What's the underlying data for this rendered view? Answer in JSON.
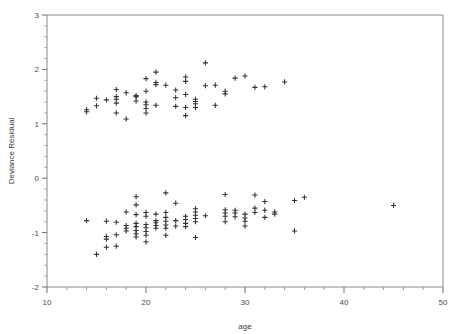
{
  "chart_data": {
    "type": "scatter",
    "title": "",
    "xlabel": "age",
    "ylabel": "Deviance  Residual",
    "xlim": [
      10,
      50
    ],
    "ylim": [
      -2,
      3
    ],
    "xticks": [
      10,
      20,
      30,
      40,
      50
    ],
    "xtick_labels": [
      "10",
      "20",
      "30",
      "40",
      "50"
    ],
    "yticks": [
      -2,
      -1,
      0,
      1,
      2,
      3
    ],
    "ytick_labels": [
      "-2",
      "-1",
      "0",
      "1",
      "2",
      "3"
    ],
    "x_minor_step": 2,
    "y_minor_step": 0.2,
    "grid": false,
    "legend": "none",
    "marker": "plus",
    "marker_color": "#333333",
    "series": [
      {
        "name": "Deviance residuals",
        "points": [
          [
            14.0,
            1.26
          ],
          [
            14.0,
            1.22
          ],
          [
            15.0,
            1.47
          ],
          [
            15.0,
            1.33
          ],
          [
            16.0,
            1.44
          ],
          [
            17.0,
            1.63
          ],
          [
            17.0,
            1.5
          ],
          [
            17.0,
            1.45
          ],
          [
            17.0,
            1.38
          ],
          [
            17.0,
            1.2
          ],
          [
            18.0,
            1.57
          ],
          [
            18.0,
            1.09
          ],
          [
            19.0,
            1.52
          ],
          [
            19.0,
            1.5
          ],
          [
            19.0,
            1.42
          ],
          [
            20.0,
            1.83
          ],
          [
            20.0,
            1.6
          ],
          [
            20.0,
            1.4
          ],
          [
            20.0,
            1.35
          ],
          [
            20.0,
            1.28
          ],
          [
            20.0,
            1.2
          ],
          [
            21.0,
            1.95
          ],
          [
            21.0,
            1.76
          ],
          [
            21.0,
            1.72
          ],
          [
            21.0,
            1.34
          ],
          [
            22.0,
            1.71
          ],
          [
            23.0,
            1.62
          ],
          [
            23.0,
            1.48
          ],
          [
            23.0,
            1.32
          ],
          [
            24.0,
            1.86
          ],
          [
            24.0,
            1.78
          ],
          [
            24.0,
            1.54
          ],
          [
            24.0,
            1.3
          ],
          [
            24.0,
            1.15
          ],
          [
            25.0,
            1.45
          ],
          [
            25.0,
            1.41
          ],
          [
            25.0,
            1.37
          ],
          [
            25.0,
            1.3
          ],
          [
            26.0,
            2.12
          ],
          [
            26.0,
            1.7
          ],
          [
            27.0,
            1.71
          ],
          [
            27.0,
            1.34
          ],
          [
            28.0,
            1.6
          ],
          [
            28.0,
            1.55
          ],
          [
            29.0,
            1.84
          ],
          [
            30.0,
            1.88
          ],
          [
            31.0,
            1.67
          ],
          [
            32.0,
            1.68
          ],
          [
            34.0,
            1.77
          ],
          [
            14.0,
            -0.78
          ],
          [
            15.0,
            -1.4
          ],
          [
            16.0,
            -0.79
          ],
          [
            16.0,
            -1.07
          ],
          [
            16.0,
            -1.12
          ],
          [
            16.0,
            -1.27
          ],
          [
            17.0,
            -0.81
          ],
          [
            17.0,
            -1.04
          ],
          [
            17.0,
            -1.25
          ],
          [
            18.0,
            -0.62
          ],
          [
            18.0,
            -0.87
          ],
          [
            18.0,
            -0.92
          ],
          [
            18.0,
            -0.97
          ],
          [
            19.0,
            -0.34
          ],
          [
            19.0,
            -0.49
          ],
          [
            19.0,
            -0.67
          ],
          [
            19.0,
            -0.83
          ],
          [
            19.0,
            -0.89
          ],
          [
            19.0,
            -0.96
          ],
          [
            19.0,
            -1.02
          ],
          [
            19.0,
            -1.08
          ],
          [
            20.0,
            -0.63
          ],
          [
            20.0,
            -0.7
          ],
          [
            20.0,
            -0.85
          ],
          [
            20.0,
            -0.91
          ],
          [
            20.0,
            -0.98
          ],
          [
            20.0,
            -1.05
          ],
          [
            20.0,
            -1.17
          ],
          [
            21.0,
            -0.66
          ],
          [
            21.0,
            -0.78
          ],
          [
            21.0,
            -0.82
          ],
          [
            21.0,
            -0.87
          ],
          [
            21.0,
            -0.92
          ],
          [
            22.0,
            -0.27
          ],
          [
            22.0,
            -0.63
          ],
          [
            22.0,
            -0.72
          ],
          [
            22.0,
            -0.79
          ],
          [
            22.0,
            -0.86
          ],
          [
            22.0,
            -0.92
          ],
          [
            22.0,
            -1.05
          ],
          [
            23.0,
            -0.46
          ],
          [
            23.0,
            -0.78
          ],
          [
            23.0,
            -0.88
          ],
          [
            24.0,
            -0.7
          ],
          [
            24.0,
            -0.76
          ],
          [
            24.0,
            -0.83
          ],
          [
            24.0,
            -0.89
          ],
          [
            25.0,
            -0.56
          ],
          [
            25.0,
            -0.62
          ],
          [
            25.0,
            -0.68
          ],
          [
            25.0,
            -0.74
          ],
          [
            25.0,
            -0.8
          ],
          [
            25.0,
            -1.09
          ],
          [
            26.0,
            -0.69
          ],
          [
            28.0,
            -0.3
          ],
          [
            28.0,
            -0.58
          ],
          [
            28.0,
            -0.64
          ],
          [
            28.0,
            -0.7
          ],
          [
            28.0,
            -0.8
          ],
          [
            29.0,
            -0.59
          ],
          [
            29.0,
            -0.64
          ],
          [
            29.0,
            -0.71
          ],
          [
            30.0,
            -0.66
          ],
          [
            30.0,
            -0.73
          ],
          [
            30.0,
            -0.79
          ],
          [
            30.0,
            -0.88
          ],
          [
            31.0,
            -0.31
          ],
          [
            31.0,
            -0.55
          ],
          [
            31.0,
            -0.63
          ],
          [
            32.0,
            -0.43
          ],
          [
            32.0,
            -0.59
          ],
          [
            32.0,
            -0.72
          ],
          [
            33.0,
            -0.62
          ],
          [
            33.0,
            -0.66
          ],
          [
            35.0,
            -0.41
          ],
          [
            35.0,
            -0.97
          ],
          [
            36.0,
            -0.35
          ],
          [
            45.0,
            -0.5
          ]
        ]
      }
    ],
    "n_points": 125,
    "frame": {
      "left": 47,
      "right": 443,
      "top": 15,
      "bottom": 287
    }
  }
}
